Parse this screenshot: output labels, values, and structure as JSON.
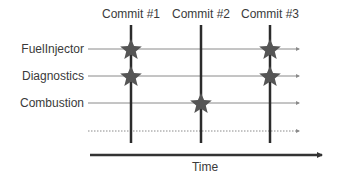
{
  "diagram": {
    "commits": [
      {
        "label": "Commit #1",
        "x": 131
      },
      {
        "label": "Commit #2",
        "x": 201
      },
      {
        "label": "Commit #3",
        "x": 270
      }
    ],
    "rows": [
      {
        "label": "FuelInjector",
        "y": 49,
        "style": "solid",
        "changed_in": [
          "Commit #1",
          "Commit #3"
        ]
      },
      {
        "label": "Diagnostics",
        "y": 76,
        "style": "solid",
        "changed_in": [
          "Commit #1",
          "Commit #3"
        ]
      },
      {
        "label": "Combustion",
        "y": 103,
        "style": "solid",
        "changed_in": [
          "Commit #2"
        ]
      },
      {
        "label": "",
        "y": 131,
        "style": "dotted",
        "changed_in": []
      }
    ],
    "axis": {
      "label": "Time"
    },
    "colors": {
      "commit_line": "#2b2b2b",
      "row_line": "#8a8a8a",
      "star": "#555555",
      "axis": "#333333"
    }
  }
}
